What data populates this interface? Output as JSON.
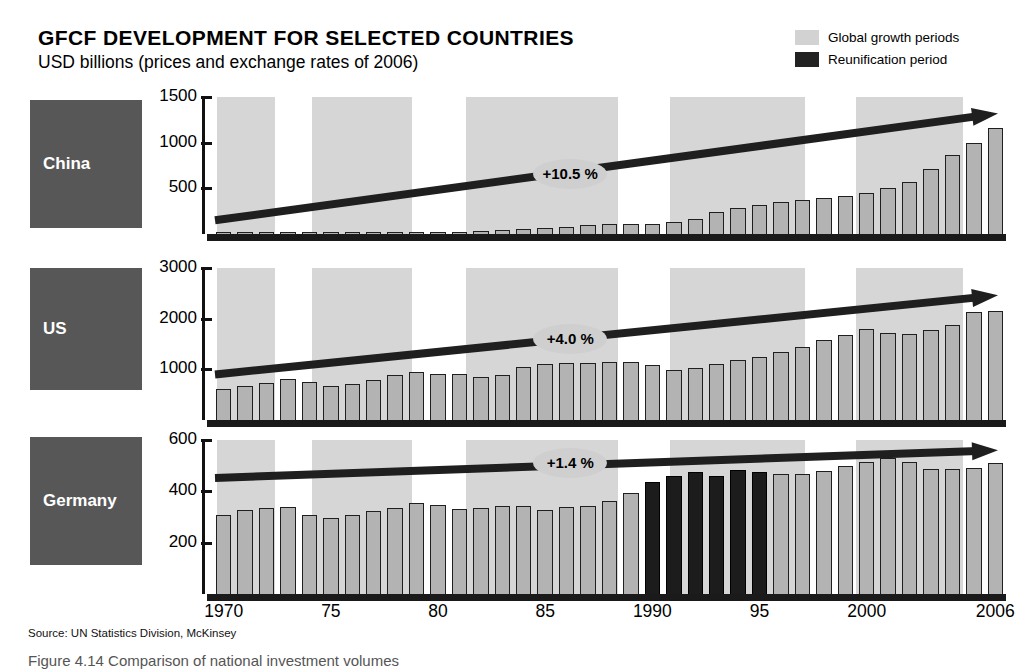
{
  "header": {
    "title": "GFCF DEVELOPMENT FOR SELECTED COUNTRIES",
    "subtitle": "USD billions (prices and exchange rates of 2006)"
  },
  "legend": {
    "items": [
      {
        "label": "Global growth periods",
        "color": "#d2d2d2",
        "icon": "legend-swatch-growth"
      },
      {
        "label": "Reunification period",
        "color": "#222222",
        "icon": "legend-swatch-reunification"
      }
    ]
  },
  "source": "Source: UN Statistics Division, McKinsey",
  "caption": "Figure 4.14   Comparison of national investment volumes",
  "xaxis": {
    "labels": [
      "1970",
      "75",
      "80",
      "85",
      "1990",
      "95",
      "2000",
      "2006"
    ],
    "label_years": [
      1970,
      1975,
      1980,
      1985,
      1990,
      1995,
      2000,
      2006
    ],
    "start_year": 1970,
    "end_year": 2006
  },
  "growth_bands": [
    {
      "start": 1970.2,
      "end": 1972.9
    },
    {
      "start": 1974.6,
      "end": 1979.3
    },
    {
      "start": 1981.8,
      "end": 1988.9
    },
    {
      "start": 1991.3,
      "end": 1997.6
    },
    {
      "start": 2000.0,
      "end": 2005.0
    }
  ],
  "reunification_band": {
    "start": 1990,
    "end": 1995
  },
  "chart_data": [
    {
      "type": "bar",
      "title": "China",
      "panel": "china",
      "ylabel": "USD billions",
      "ylim": [
        0,
        1500
      ],
      "yticks": [
        500,
        1000,
        1500
      ],
      "ytick_labels": [
        "500",
        "1000",
        "1500"
      ],
      "grid": false,
      "bar_color": "#b3b3b3",
      "cagr_label": "+10.5 %",
      "cagr_value": 10.5,
      "x": [
        1970,
        1971,
        1972,
        1973,
        1974,
        1975,
        1976,
        1977,
        1978,
        1979,
        1980,
        1981,
        1982,
        1983,
        1984,
        1985,
        1986,
        1987,
        1988,
        1989,
        1990,
        1991,
        1992,
        1993,
        1994,
        1995,
        1996,
        1997,
        1998,
        1999,
        2000,
        2001,
        2002,
        2003,
        2004,
        2005,
        2006
      ],
      "values": [
        18,
        19,
        20,
        22,
        23,
        25,
        25,
        28,
        33,
        36,
        38,
        38,
        43,
        50,
        62,
        77,
        90,
        105,
        125,
        120,
        118,
        140,
        180,
        250,
        300,
        330,
        360,
        380,
        400,
        430,
        460,
        510,
        580,
        720,
        880,
        1010,
        1170
      ],
      "trend_start": 150,
      "trend_end": 1320
    },
    {
      "type": "bar",
      "title": "US",
      "panel": "us",
      "ylabel": "USD billions",
      "ylim": [
        0,
        3000
      ],
      "yticks": [
        1000,
        2000,
        3000
      ],
      "ytick_labels": [
        "1000",
        "2000",
        "3000"
      ],
      "grid": false,
      "bar_color": "#b3b3b3",
      "cagr_label": "+4.0 %",
      "cagr_value": 4.0,
      "x": [
        1970,
        1971,
        1972,
        1973,
        1974,
        1975,
        1976,
        1977,
        1978,
        1979,
        1980,
        1981,
        1982,
        1983,
        1984,
        1985,
        1986,
        1987,
        1988,
        1989,
        1990,
        1991,
        1992,
        1993,
        1994,
        1995,
        1996,
        1997,
        1998,
        1999,
        2000,
        2001,
        2002,
        2003,
        2004,
        2005,
        2006
      ],
      "values": [
        640,
        690,
        760,
        830,
        770,
        700,
        740,
        810,
        900,
        960,
        930,
        930,
        860,
        900,
        1060,
        1130,
        1140,
        1140,
        1170,
        1160,
        1110,
        1000,
        1040,
        1120,
        1210,
        1270,
        1370,
        1470,
        1590,
        1700,
        1810,
        1740,
        1710,
        1790,
        1900,
        2150,
        2180
      ],
      "trend_start": 900,
      "trend_end": 2460
    },
    {
      "type": "bar",
      "title": "Germany",
      "panel": "germany",
      "ylabel": "USD billions",
      "ylim": [
        0,
        600
      ],
      "yticks": [
        200,
        400,
        600
      ],
      "ytick_labels": [
        "200",
        "400",
        "600"
      ],
      "grid": false,
      "bar_color": "#b3b3b3",
      "reunification_color": "#1c1c1c",
      "cagr_label": "+1.4 %",
      "cagr_value": 1.4,
      "x": [
        1970,
        1971,
        1972,
        1973,
        1974,
        1975,
        1976,
        1977,
        1978,
        1979,
        1980,
        1981,
        1982,
        1983,
        1984,
        1985,
        1986,
        1987,
        1988,
        1989,
        1990,
        1991,
        1992,
        1993,
        1994,
        1995,
        1996,
        1997,
        1998,
        1999,
        2000,
        2001,
        2002,
        2003,
        2004,
        2005,
        2006
      ],
      "values": [
        312,
        332,
        340,
        342,
        313,
        299,
        311,
        327,
        338,
        360,
        352,
        337,
        340,
        346,
        346,
        333,
        341,
        346,
        365,
        398,
        440,
        462,
        480,
        462,
        487,
        481,
        470,
        472,
        485,
        503,
        520,
        535,
        520,
        490,
        490,
        493,
        516
      ],
      "reunification_years": [
        1990,
        1991,
        1992,
        1993,
        1994,
        1995
      ],
      "trend_start": 452,
      "trend_end": 560
    }
  ],
  "panels_meta": [
    {
      "name": "China",
      "plate_label": "China"
    },
    {
      "name": "US",
      "plate_label": "US"
    },
    {
      "name": "Germany",
      "plate_label": "Germany"
    }
  ],
  "colors": {
    "band": "#d6d6d6",
    "bar": "#b3b3b3",
    "bar_outline": "#1f1f1f",
    "dark_bar": "#1c1c1c",
    "plate": "#575757",
    "baseline": "#1a1a1a",
    "bubble": "#cfcfcf"
  }
}
